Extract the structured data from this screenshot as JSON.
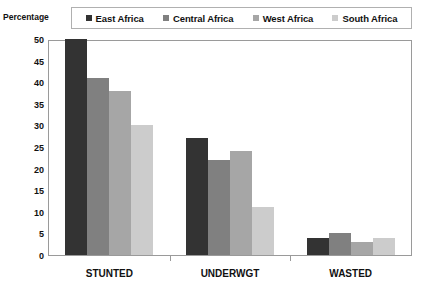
{
  "chart_data": {
    "type": "bar",
    "title": "",
    "xlabel": "",
    "ylabel": "Percentage",
    "ylim": [
      0,
      50
    ],
    "ytick_step": 5,
    "yticks": [
      "50",
      "45",
      "40",
      "35",
      "30",
      "25",
      "20",
      "15",
      "10",
      "5",
      "0"
    ],
    "grid": false,
    "legend_position": "top",
    "categories": [
      "STUNTED",
      "UNDERWGT",
      "WASTED"
    ],
    "series": [
      {
        "name": "East Africa",
        "color": "#333333",
        "values": [
          50,
          27,
          4
        ]
      },
      {
        "name": "Central Africa",
        "color": "#808080",
        "values": [
          41,
          22,
          5
        ]
      },
      {
        "name": "West Africa",
        "color": "#a6a6a6",
        "values": [
          38,
          24,
          3
        ]
      },
      {
        "name": "South Africa",
        "color": "#cccccc",
        "values": [
          30,
          11,
          4
        ]
      }
    ]
  },
  "axis": {
    "y_title": "Percentage"
  }
}
